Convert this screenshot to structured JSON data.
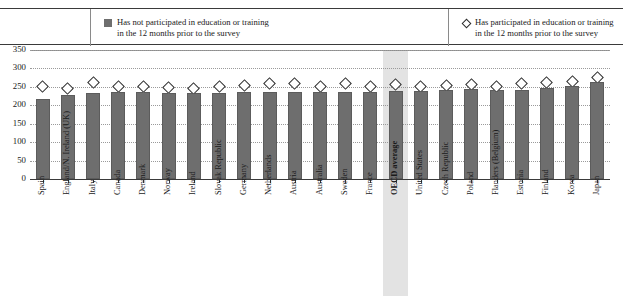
{
  "legend": {
    "bar_series_label": "Has not participated in education or training\nin the 12 months prior to the survey",
    "marker_series_label": "Has participated in education or training\nin the 12 months prior to the survey",
    "bar_swatch_icon": "filled-square-icon",
    "marker_swatch_icon": "open-diamond-icon"
  },
  "chart_data": {
    "type": "bar",
    "title": "",
    "subtitle": "",
    "xlabel": "",
    "ylabel": "",
    "ylim": [
      0,
      350
    ],
    "yticks": [
      0,
      50,
      100,
      150,
      200,
      250,
      300,
      350
    ],
    "ytick_labels": [
      "0",
      "50",
      "100",
      "150",
      "200",
      "250",
      "300",
      "350"
    ],
    "grid": true,
    "legend_position": "top",
    "highlight_category": "OECD average",
    "highlight_color": "#e3e3e3",
    "bar_color": "#6e6e6e",
    "marker_color": "#ffffff",
    "marker_edge_color": "#2b2b2b",
    "categories": [
      "Spain",
      "England/N. Ireland (UK)",
      "Italy",
      "Canada",
      "Denmark",
      "Norway",
      "Ireland",
      "Slovak Republic",
      "Germany",
      "Netherlands",
      "Austria",
      "Australia",
      "Sweden",
      "France",
      "OECD average",
      "United States",
      "Czech Republic",
      "Poland",
      "Flanders (Belgium)",
      "Estonia",
      "Finland",
      "Korea",
      "Japan"
    ],
    "series": [
      {
        "name": "Has not participated in education or training in the 12 months prior to the survey",
        "type": "bar",
        "values": [
          218,
          228,
          232,
          235,
          235,
          234,
          232,
          234,
          235,
          236,
          236,
          236,
          237,
          237,
          239,
          240,
          242,
          243,
          241,
          242,
          248,
          252,
          262
        ]
      },
      {
        "name": "Has participated in education or training in the 12 months prior to the survey",
        "type": "scatter",
        "marker": "diamond",
        "values": [
          252,
          246,
          262,
          252,
          252,
          248,
          246,
          250,
          255,
          258,
          260,
          252,
          258,
          250,
          256,
          252,
          255,
          256,
          252,
          258,
          261,
          264,
          275
        ]
      }
    ]
  }
}
